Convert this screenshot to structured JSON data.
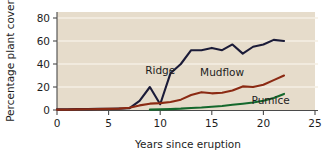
{
  "chart_data": {
    "type": "line",
    "title": "",
    "xlabel": "Years since eruption",
    "ylabel": "Percentage plant cover",
    "xlim": [
      0,
      25
    ],
    "ylim": [
      0,
      88
    ],
    "xticks": [
      0,
      5,
      10,
      15,
      20,
      25
    ],
    "yticks": [
      0,
      20,
      40,
      60,
      80
    ],
    "xtick_labels": [
      "0",
      "5",
      "10",
      "15",
      "20",
      "25"
    ],
    "ytick_labels": [
      "0",
      "20",
      "40",
      "60",
      "80"
    ],
    "grid": "horizontal",
    "legend_position": "inline-annotations",
    "plot_background": "#e6dccb",
    "series": [
      {
        "name": "Ridge",
        "color": "#1b1b38",
        "label_x": 10.0,
        "label_y": 31,
        "x": [
          0,
          1,
          2,
          3,
          4,
          5,
          6,
          7,
          8,
          9,
          10,
          11,
          12,
          13,
          14,
          15,
          16,
          17,
          18,
          19,
          20,
          21,
          22
        ],
        "y": [
          0.5,
          0.5,
          0.8,
          0.8,
          1.0,
          1.0,
          1.2,
          1.5,
          8,
          20,
          5,
          32,
          40,
          52,
          52,
          54,
          52,
          57,
          49,
          55,
          57,
          61,
          60
        ]
      },
      {
        "name": "Mudflow",
        "color": "#8b2a13",
        "label_x": 16.0,
        "label_y": 30,
        "x": [
          0,
          1,
          2,
          3,
          4,
          5,
          6,
          7,
          8,
          9,
          10,
          11,
          12,
          13,
          14,
          15,
          16,
          17,
          18,
          19,
          20,
          21,
          22
        ],
        "y": [
          0.3,
          0.3,
          0.5,
          0.6,
          0.8,
          1.0,
          1.2,
          2.0,
          4.0,
          5.5,
          6.0,
          7.0,
          9.0,
          13.0,
          15.5,
          14.5,
          15.0,
          17.0,
          20.5,
          20.0,
          22.0,
          26.0,
          30.0
        ]
      },
      {
        "name": "Pumice",
        "color": "#14682c",
        "label_x": 20.7,
        "label_y": 5,
        "x": [
          9,
          10,
          11,
          12,
          13,
          14,
          15,
          16,
          17,
          18,
          19,
          20,
          21,
          22
        ],
        "y": [
          0.3,
          0.5,
          0.8,
          1.2,
          1.8,
          2.2,
          2.8,
          3.5,
          4.5,
          5.5,
          6.5,
          8.0,
          10.5,
          14.0
        ]
      }
    ]
  }
}
